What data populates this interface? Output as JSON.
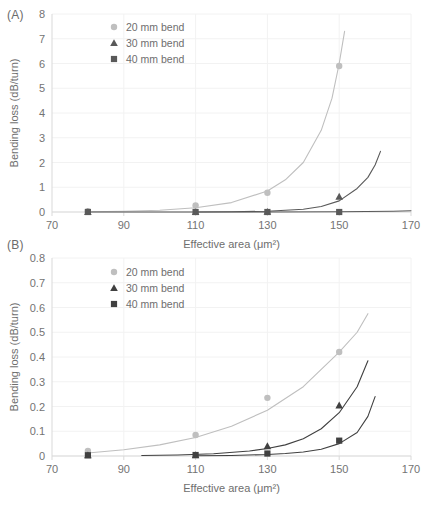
{
  "figure": {
    "panel_a_label": "(A)",
    "panel_b_label": "(B)"
  },
  "chart_data": [
    {
      "id": "panel-a",
      "type": "scatter",
      "panel": "(A)",
      "title": "",
      "xlabel": "Effective area (μm²)",
      "ylabel": "Bending loss (dB/turn)",
      "xlim": [
        70,
        170
      ],
      "ylim": [
        0,
        8
      ],
      "xticks": [
        70,
        90,
        110,
        130,
        150,
        170
      ],
      "xtick_labels": [
        "70",
        "90",
        "110",
        "130",
        "150",
        "170"
      ],
      "yticks": [
        0,
        1,
        2,
        3,
        4,
        5,
        6,
        7,
        8
      ],
      "ytick_labels": [
        "0",
        "1",
        "2",
        "3",
        "4",
        "5",
        "6",
        "7",
        "8"
      ],
      "grid": true,
      "legend_position": "top-left-inside",
      "series": [
        {
          "name": "20 mm bend",
          "marker": "circle",
          "color": "#bfbfbf",
          "x": [
            80,
            110,
            130,
            150
          ],
          "values": [
            0.03,
            0.26,
            0.78,
            5.9
          ],
          "curve_x": [
            80,
            90,
            100,
            110,
            120,
            130,
            135,
            140,
            145,
            148,
            150,
            151.5
          ],
          "curve_y": [
            0.01,
            0.03,
            0.07,
            0.17,
            0.38,
            0.85,
            1.3,
            2.0,
            3.3,
            4.6,
            6.0,
            7.3
          ]
        },
        {
          "name": "30 mm bend",
          "marker": "triangle",
          "color": "#595959",
          "x": [
            80,
            110,
            130,
            150
          ],
          "values": [
            0.0,
            0.0,
            0.01,
            0.62
          ],
          "curve_x": [
            110,
            120,
            130,
            140,
            145,
            150,
            155,
            158,
            160,
            161.5
          ],
          "curve_y": [
            0.0,
            0.01,
            0.03,
            0.11,
            0.22,
            0.45,
            0.95,
            1.4,
            1.9,
            2.45
          ]
        },
        {
          "name": "40 mm bend",
          "marker": "square",
          "color": "#595959",
          "x": [
            80,
            110,
            130,
            150
          ],
          "values": [
            0.0,
            0.0,
            0.0,
            0.0
          ],
          "curve_x": [
            80,
            110,
            130,
            150,
            165,
            170
          ],
          "curve_y": [
            0.0,
            0.0,
            0.0,
            0.01,
            0.03,
            0.05
          ]
        }
      ]
    },
    {
      "id": "panel-b",
      "type": "scatter",
      "panel": "(B)",
      "title": "",
      "xlabel": "Effective area (μm²)",
      "ylabel": "Bending loss (dB/turn)",
      "xlim": [
        70,
        170
      ],
      "ylim": [
        0,
        0.8
      ],
      "xticks": [
        70,
        90,
        110,
        130,
        150,
        170
      ],
      "xtick_labels": [
        "70",
        "90",
        "110",
        "130",
        "150",
        "170"
      ],
      "yticks": [
        0,
        0.1,
        0.2,
        0.3,
        0.4,
        0.5,
        0.6,
        0.7,
        0.8
      ],
      "ytick_labels": [
        "0",
        "0.1",
        "0.2",
        "0.3",
        "0.4",
        "0.5",
        "0.6",
        "0.7",
        "0.8"
      ],
      "grid": true,
      "legend_position": "top-left-inside",
      "series": [
        {
          "name": "20 mm bend",
          "marker": "circle",
          "color": "#bfbfbf",
          "x": [
            80,
            110,
            130,
            150
          ],
          "values": [
            0.02,
            0.085,
            0.235,
            0.42
          ],
          "curve_x": [
            80,
            90,
            100,
            110,
            120,
            130,
            140,
            150,
            155,
            158
          ],
          "curve_y": [
            0.012,
            0.025,
            0.045,
            0.075,
            0.12,
            0.185,
            0.28,
            0.42,
            0.5,
            0.575
          ]
        },
        {
          "name": "30 mm bend",
          "marker": "triangle",
          "color": "#404040",
          "x": [
            80,
            110,
            130,
            150
          ],
          "values": [
            0.003,
            0.004,
            0.04,
            0.205
          ],
          "curve_x": [
            95,
            105,
            115,
            125,
            130,
            135,
            140,
            145,
            150,
            155,
            158
          ],
          "curve_y": [
            0.002,
            0.004,
            0.009,
            0.02,
            0.03,
            0.045,
            0.07,
            0.11,
            0.175,
            0.28,
            0.385
          ]
        },
        {
          "name": "40 mm bend",
          "marker": "square",
          "color": "#404040",
          "x": [
            80,
            110,
            130,
            150
          ],
          "values": [
            0.003,
            0.004,
            0.01,
            0.062
          ],
          "curve_x": [
            110,
            120,
            130,
            135,
            140,
            145,
            150,
            155,
            158,
            160
          ],
          "curve_y": [
            0.001,
            0.002,
            0.006,
            0.01,
            0.016,
            0.027,
            0.05,
            0.095,
            0.16,
            0.24
          ]
        }
      ]
    }
  ]
}
